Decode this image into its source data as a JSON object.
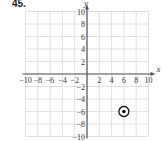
{
  "problem": {
    "number": "45."
  },
  "chart_data": {
    "type": "scatter",
    "title": "",
    "xlabel": "x",
    "ylabel": "y",
    "xlim": [
      -10,
      10
    ],
    "ylim": [
      -10,
      10
    ],
    "grid": true,
    "x_ticks": [
      -10,
      -8,
      -6,
      -4,
      -2,
      2,
      4,
      6,
      8,
      10
    ],
    "y_ticks": [
      10,
      8,
      6,
      4,
      2,
      -2,
      -4,
      -6,
      -8,
      -10
    ],
    "x_tick_labels": [
      "−10",
      "−8",
      "−6",
      "−4",
      "−2",
      "2",
      "4",
      "6",
      "8",
      "10"
    ],
    "y_tick_labels": [
      "10",
      "8",
      "6",
      "4",
      "2",
      "−2",
      "−4",
      "−6",
      "−8",
      "−10"
    ],
    "series": [
      {
        "name": "point",
        "points": [
          {
            "x": 6,
            "y": -6,
            "marker": "ringed-dot"
          }
        ]
      }
    ],
    "colors": {
      "grid": "#d8d8d8",
      "axis": "#555555",
      "point": "#111111"
    }
  }
}
